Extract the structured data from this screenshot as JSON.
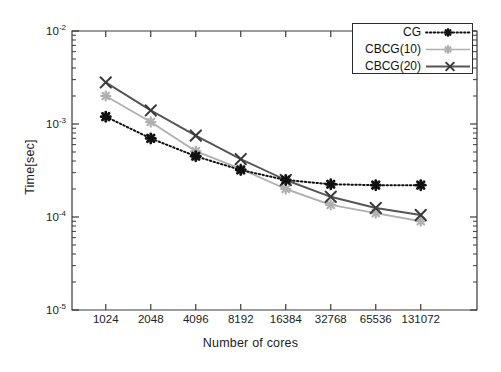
{
  "chart_data": {
    "type": "line",
    "title": "",
    "xlabel": "Number of cores",
    "ylabel": "Time[sec]",
    "xscale": "log2",
    "yscale": "log10",
    "grid": false,
    "legend_position": "top-right",
    "categories": [
      1024,
      2048,
      4096,
      8192,
      16384,
      32768,
      65536,
      131072
    ],
    "xtick_labels": [
      "1024",
      "2048",
      "4096",
      "8192",
      "16384",
      "32768",
      "65536",
      "131072"
    ],
    "ytick_labels": [
      "10",
      "10",
      "10",
      "10"
    ],
    "ytick_exponents": [
      "-2",
      "-3",
      "-4",
      "-5"
    ],
    "ylim": [
      1e-05,
      0.01
    ],
    "series": [
      {
        "name": "CG",
        "color": "#111111",
        "linestyle": "dotted",
        "marker": "asterisk",
        "values": [
          0.0012,
          0.0007,
          0.00045,
          0.00032,
          0.00025,
          0.000225,
          0.00022,
          0.00022
        ]
      },
      {
        "name": "CBCG(10)",
        "color": "#b0b0b0",
        "linestyle": "solid",
        "marker": "asterisk",
        "values": [
          0.002,
          0.00105,
          0.00051,
          0.00033,
          0.0002,
          0.000135,
          0.00011,
          9e-05
        ]
      },
      {
        "name": "CBCG(20)",
        "color": "#555555",
        "linestyle": "solid",
        "marker": "cross",
        "values": [
          0.0028,
          0.0014,
          0.00075,
          0.00042,
          0.00025,
          0.000165,
          0.000125,
          0.000105
        ]
      }
    ]
  },
  "legend": {
    "entries": [
      {
        "label": "CG"
      },
      {
        "label": "CBCG(10)"
      },
      {
        "label": "CBCG(20)"
      }
    ]
  },
  "axes": {
    "x_title": "Number of cores",
    "y_title": "Time[sec]"
  }
}
